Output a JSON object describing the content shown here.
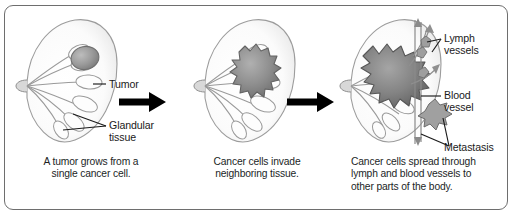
{
  "diagram": {
    "border_color": "#6e6e6e",
    "background_color": "#ffffff",
    "arrow_color": "#000000",
    "label_color": "#1a1a1a",
    "tissue_stroke": "#8a8a8a",
    "tumor_fill": "#8f8f8f"
  },
  "panels": [
    {
      "id": "panel-1",
      "stage": "primary-tumor",
      "caption_lines": [
        "A tumor grows from a",
        "single cancer cell."
      ],
      "labels": [
        {
          "id": "tumor",
          "lines": [
            "Tumor"
          ]
        },
        {
          "id": "glandular",
          "lines": [
            "Glandular",
            "tissue"
          ]
        }
      ]
    },
    {
      "id": "panel-2",
      "stage": "local-invasion",
      "caption_lines": [
        "Cancer cells invade",
        "neighboring tissue."
      ],
      "labels": []
    },
    {
      "id": "panel-3",
      "stage": "metastatic-spread",
      "caption_lines": [
        "Cancer cells spread through",
        "lymph and blood vessels to",
        "other parts of the body."
      ],
      "labels": [
        {
          "id": "lymph",
          "lines": [
            "Lymph",
            "vessels"
          ]
        },
        {
          "id": "blood",
          "lines": [
            "Blood",
            "vessel"
          ]
        },
        {
          "id": "metastasis",
          "lines": [
            "Metastasis"
          ]
        }
      ]
    }
  ],
  "arrows": [
    {
      "id": "arrow-1",
      "direction": "right"
    },
    {
      "id": "arrow-2",
      "direction": "right"
    }
  ]
}
